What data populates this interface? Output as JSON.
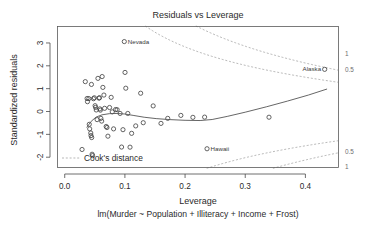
{
  "chart_data": {
    "type": "scatter",
    "title": "Residuals vs Leverage",
    "xlabel": "Leverage",
    "sub_xlabel": "lm(Murder ~ Population + Illiteracy + Income + Frost)",
    "ylabel": "Standardized residuals",
    "xlim": [
      -0.012,
      0.455
    ],
    "ylim": [
      -2.45,
      3.72
    ],
    "grid": false,
    "legend_position": "bottom-left",
    "x_ticks": [
      "0.0",
      "0.1",
      "0.2",
      "0.3",
      "0.4"
    ],
    "x_tick_values": [
      0.0,
      0.1,
      0.2,
      0.3,
      0.4
    ],
    "y_ticks": [
      "3",
      "2",
      "1",
      "0",
      "-1",
      "-2"
    ],
    "y_tick_values": [
      3,
      2,
      1,
      0,
      -1,
      -2
    ],
    "legend": [
      {
        "label": "Cook's distance",
        "style": "dashed-line",
        "color": "#9a9a9a"
      }
    ],
    "point_marker": "open-circle",
    "point_color": "#3d3d3d",
    "points": [
      {
        "x": 0.0288,
        "y": -1.662,
        "label": ""
      },
      {
        "x": 0.0342,
        "y": 1.307,
        "label": ""
      },
      {
        "x": 0.0372,
        "y": 0.57,
        "label": ""
      },
      {
        "x": 0.0378,
        "y": 0.43,
        "label": ""
      },
      {
        "x": 0.0401,
        "y": 0.566,
        "label": ""
      },
      {
        "x": 0.0408,
        "y": -0.56,
        "label": ""
      },
      {
        "x": 0.0415,
        "y": -0.76,
        "label": ""
      },
      {
        "x": 0.0433,
        "y": -0.94,
        "label": ""
      },
      {
        "x": 0.0437,
        "y": -1.055,
        "label": ""
      },
      {
        "x": 0.0444,
        "y": 1.185,
        "label": ""
      },
      {
        "x": 0.0448,
        "y": -1.14,
        "label": ""
      },
      {
        "x": 0.0455,
        "y": -1.87,
        "label": ""
      },
      {
        "x": 0.0462,
        "y": -1.93,
        "label": ""
      },
      {
        "x": 0.0478,
        "y": 0.56,
        "label": ""
      },
      {
        "x": 0.0492,
        "y": 0.6,
        "label": ""
      },
      {
        "x": 0.0505,
        "y": 0.255,
        "label": ""
      },
      {
        "x": 0.0513,
        "y": 0.18,
        "label": ""
      },
      {
        "x": 0.0524,
        "y": 0.068,
        "label": ""
      },
      {
        "x": 0.0538,
        "y": -0.355,
        "label": ""
      },
      {
        "x": 0.0552,
        "y": 1.45,
        "label": ""
      },
      {
        "x": 0.0569,
        "y": 0.585,
        "label": ""
      },
      {
        "x": 0.0578,
        "y": 0.602,
        "label": ""
      },
      {
        "x": 0.0584,
        "y": 0.115,
        "label": ""
      },
      {
        "x": 0.0593,
        "y": 0.06,
        "label": ""
      },
      {
        "x": 0.0601,
        "y": -0.3,
        "label": ""
      },
      {
        "x": 0.0614,
        "y": -0.42,
        "label": ""
      },
      {
        "x": 0.0622,
        "y": 1.53,
        "label": ""
      },
      {
        "x": 0.0634,
        "y": 1.055,
        "label": ""
      },
      {
        "x": 0.0651,
        "y": 0.72,
        "label": ""
      },
      {
        "x": 0.0663,
        "y": 0.14,
        "label": ""
      },
      {
        "x": 0.0689,
        "y": -0.655,
        "label": ""
      },
      {
        "x": 0.0702,
        "y": -0.7,
        "label": ""
      },
      {
        "x": 0.0718,
        "y": -1.08,
        "label": ""
      },
      {
        "x": 0.0745,
        "y": 0.175,
        "label": ""
      },
      {
        "x": 0.0772,
        "y": 0.62,
        "label": ""
      },
      {
        "x": 0.079,
        "y": -0.015,
        "label": ""
      },
      {
        "x": 0.0812,
        "y": -0.76,
        "label": ""
      },
      {
        "x": 0.0845,
        "y": 0.085,
        "label": ""
      },
      {
        "x": 0.0871,
        "y": 0.08,
        "label": ""
      },
      {
        "x": 0.092,
        "y": -0.085,
        "label": ""
      },
      {
        "x": 0.0945,
        "y": -1.555,
        "label": ""
      },
      {
        "x": 0.0968,
        "y": -0.795,
        "label": ""
      },
      {
        "x": 0.099,
        "y": 3.06,
        "label": "Nevada",
        "label_side": "right"
      },
      {
        "x": 0.1002,
        "y": 1.71,
        "label": ""
      },
      {
        "x": 0.1015,
        "y": 1.02,
        "label": ""
      },
      {
        "x": 0.1048,
        "y": -0.085,
        "label": ""
      },
      {
        "x": 0.1085,
        "y": -1.56,
        "label": ""
      },
      {
        "x": 0.1112,
        "y": -0.955,
        "label": ""
      },
      {
        "x": 0.118,
        "y": -0.63,
        "label": ""
      },
      {
        "x": 0.1262,
        "y": 0.8,
        "label": ""
      },
      {
        "x": 0.1305,
        "y": -0.49,
        "label": ""
      },
      {
        "x": 0.147,
        "y": 0.245,
        "label": ""
      },
      {
        "x": 0.16,
        "y": -0.52,
        "label": ""
      },
      {
        "x": 0.1712,
        "y": -0.3,
        "label": ""
      },
      {
        "x": 0.193,
        "y": -0.17,
        "label": ""
      },
      {
        "x": 0.213,
        "y": -0.255,
        "label": ""
      },
      {
        "x": 0.2325,
        "y": -0.245,
        "label": ""
      },
      {
        "x": 0.2365,
        "y": -1.63,
        "label": "Hawaii",
        "label_side": "right"
      },
      {
        "x": 0.3395,
        "y": -0.25,
        "label": ""
      },
      {
        "x": 0.432,
        "y": 1.845,
        "label": "Alaska",
        "label_side": "left"
      }
    ],
    "loess_curve": {
      "color": "#555555",
      "points": [
        {
          "x": 0.0365,
          "y": -0.7
        },
        {
          "x": 0.044,
          "y": -0.43
        },
        {
          "x": 0.052,
          "y": -0.245
        },
        {
          "x": 0.062,
          "y": -0.145
        },
        {
          "x": 0.074,
          "y": -0.095
        },
        {
          "x": 0.087,
          "y": -0.085
        },
        {
          "x": 0.1,
          "y": -0.11
        },
        {
          "x": 0.115,
          "y": -0.175
        },
        {
          "x": 0.132,
          "y": -0.25
        },
        {
          "x": 0.152,
          "y": -0.31
        },
        {
          "x": 0.175,
          "y": -0.355
        },
        {
          "x": 0.2,
          "y": -0.385
        },
        {
          "x": 0.225,
          "y": -0.395
        },
        {
          "x": 0.245,
          "y": -0.35
        },
        {
          "x": 0.27,
          "y": -0.215
        },
        {
          "x": 0.3,
          "y": -0.03
        },
        {
          "x": 0.335,
          "y": 0.205
        },
        {
          "x": 0.37,
          "y": 0.455
        },
        {
          "x": 0.405,
          "y": 0.72
        },
        {
          "x": 0.436,
          "y": 0.985
        }
      ]
    },
    "cooks_contours": [
      {
        "level": "1",
        "sign": "positive",
        "label": "1"
      },
      {
        "level": "0.5",
        "sign": "positive",
        "label": "0.5"
      },
      {
        "level": "0.5",
        "sign": "negative",
        "label": "0.5"
      },
      {
        "level": "1",
        "sign": "negative",
        "label": "1"
      }
    ],
    "contour_right_labels": [
      {
        "text": "1",
        "y_value": 2.52
      },
      {
        "text": "0.5",
        "y_value": 1.8
      },
      {
        "text": "0.5",
        "y_value": -1.77
      },
      {
        "text": "1",
        "y_value": -2.46
      }
    ],
    "annotations": [
      {
        "text": "Nevada",
        "x": 0.099,
        "y": 3.06
      },
      {
        "text": "Alaska",
        "x": 0.432,
        "y": 1.845
      },
      {
        "text": "Hawaii",
        "x": 0.2365,
        "y": -1.63
      }
    ]
  }
}
